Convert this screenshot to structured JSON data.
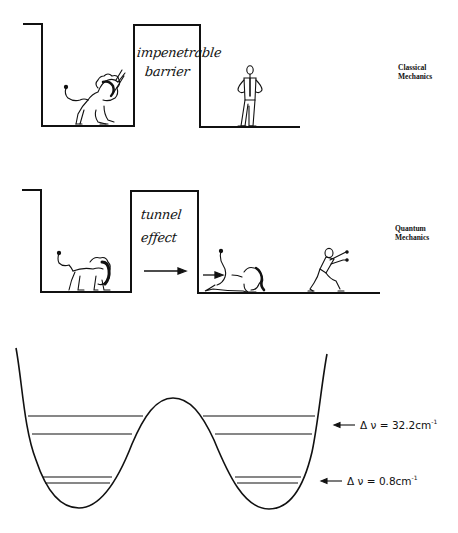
{
  "panels": [
    {
      "id": "classical",
      "label_line1": "Classical",
      "label_line2": "Mechanics",
      "barrier_text_line1": "impenetrable",
      "barrier_text_line2": "barrier"
    },
    {
      "id": "quantum",
      "label_line1": "Quantum",
      "label_line2": "Mechanics",
      "barrier_text_line1": "tunnel",
      "barrier_text_line2": "effect"
    }
  ],
  "double_well": {
    "upper_split": {
      "symbol": "Δ ν",
      "equals": "=",
      "value": "32.2",
      "unit": "cm",
      "exponent": "-1"
    },
    "lower_split": {
      "symbol": "Δ ν",
      "equals": "=",
      "value": "0.8",
      "unit": "cm",
      "exponent": "-1"
    }
  },
  "colors": {
    "ink": "#111111",
    "background": "#ffffff"
  }
}
